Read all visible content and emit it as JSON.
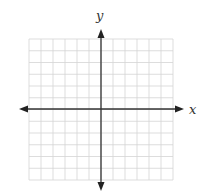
{
  "diagram": {
    "type": "coordinate-plane",
    "x_axis_label": "x",
    "y_axis_label": "y",
    "grid": {
      "columns": 12,
      "rows": 12,
      "columns_left_of_y_axis": 6,
      "columns_right_of_y_axis": 6,
      "rows_above_x_axis": 6,
      "rows_below_x_axis": 6,
      "line_color": "#d4d4d4",
      "axis_color": "#333333"
    },
    "arrows": [
      "left",
      "right",
      "up",
      "down"
    ]
  }
}
